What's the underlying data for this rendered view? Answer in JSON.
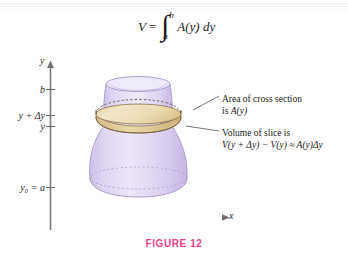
{
  "figure": {
    "caption": "FIGURE 12",
    "caption_color": "#ee3d8f",
    "background_color": "#ffffff"
  },
  "formula": {
    "lhs": "V",
    "equals": "=",
    "integral_sign": "∫",
    "lower_limit": "a",
    "upper_limit": "b",
    "integrand": "A(y) dy",
    "full_text": "V = ∫ₐᵇ A(y) dy"
  },
  "axes": {
    "y_axis_label": "y",
    "x_axis_label": "x",
    "tick_labels": [
      {
        "id": "b",
        "text": "b"
      },
      {
        "id": "y-plus-dy",
        "text": "y + Δy"
      },
      {
        "id": "y",
        "text": "y"
      },
      {
        "id": "y0-eq-a",
        "text": "y₀ = a"
      }
    ]
  },
  "callouts": [
    {
      "id": "area-of-cross-section",
      "line1": "Area of cross section",
      "line2_prefix": "is ",
      "line2_math": "A(y)"
    },
    {
      "id": "volume-of-slice",
      "line1": "Volume of slice is",
      "line2_math": "V(y + Δy) − V(y) ≈ A(y)Δy"
    }
  ],
  "solid": {
    "name": "solid-of-revolution",
    "body_color": "#ded5f0",
    "body_edge_color": "#b9a9dc",
    "slice_top_color": "#ecdcb4",
    "slice_side_color": "#dcc78e",
    "slice_edge_color": "#8a7348",
    "description": "solid of revolution with horizontal cross-sectional slice"
  }
}
